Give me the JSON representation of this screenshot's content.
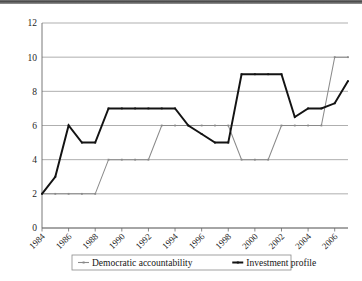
{
  "chart_data": {
    "type": "line",
    "title": "",
    "subtitle": "",
    "xlabel": "",
    "ylabel": "",
    "ylim": [
      0,
      12
    ],
    "ytick_step": 2,
    "yticks": [
      "0",
      "2",
      "4",
      "6",
      "8",
      "10",
      "12"
    ],
    "xlim": [
      1984,
      2007
    ],
    "xticks": [
      "1984",
      "1986",
      "1988",
      "1990",
      "1992",
      "1994",
      "1996",
      "1998",
      "2000",
      "2002",
      "2004",
      "2006"
    ],
    "xtick_rotation_deg": 45,
    "grid": "horizontal",
    "legend_position": "bottom",
    "x": [
      1984,
      1985,
      1986,
      1987,
      1988,
      1989,
      1990,
      1991,
      1992,
      1993,
      1994,
      1995,
      1996,
      1997,
      1998,
      1999,
      2000,
      2001,
      2002,
      2003,
      2004,
      2005,
      2006,
      2007
    ],
    "series": [
      {
        "name": "Democratic accountability",
        "color": "#8a8a8a",
        "values": [
          2,
          2,
          2,
          2,
          2,
          4,
          4,
          4,
          4,
          6,
          6,
          6,
          6,
          6,
          6,
          4,
          4,
          4,
          6,
          6,
          6,
          6,
          10,
          10
        ]
      },
      {
        "name": "Investment profile",
        "color": "#131313",
        "values": [
          2,
          3,
          6,
          5,
          5,
          7,
          7,
          7,
          7,
          7,
          7,
          6,
          5.5,
          5,
          5,
          9,
          9,
          9,
          9,
          6.5,
          7,
          7,
          7.3,
          8.6
        ]
      }
    ]
  },
  "legend": {
    "items": [
      {
        "label": "Democratic accountability"
      },
      {
        "label": "Investment profile"
      }
    ]
  },
  "colors": {
    "democratic_accountability": "#8a8a8a",
    "investment_profile": "#131313",
    "gridline": "#8c8c8c",
    "axis": "#6a6a6a",
    "background": "#ffffff"
  }
}
